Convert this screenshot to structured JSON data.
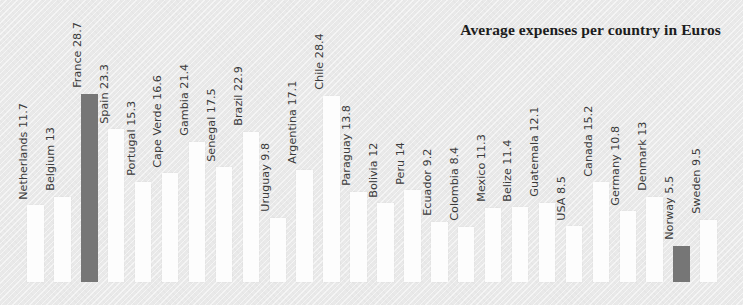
{
  "chart_data": {
    "type": "bar",
    "title": "Average expenses per country in Euros",
    "xlabel": "",
    "ylabel": "",
    "ylim": [
      0,
      28.7
    ],
    "grid": false,
    "legend": "none",
    "value_unit": "Euros",
    "categories": [
      "Netherlands",
      "Belgium",
      "France",
      "Spain",
      "Portugal",
      "Cape Verde",
      "Gambia",
      "Senegal",
      "Brazil",
      "Uruguay",
      "Argentina",
      "Chile",
      "Paraguay",
      "Bolivia",
      "Peru",
      "Ecuador",
      "Colombia",
      "Mexico",
      "Belize",
      "Guatemala",
      "USA",
      "Canada",
      "Germany",
      "Denmark",
      "Norway",
      "Sweden"
    ],
    "values": [
      11.7,
      13,
      28.7,
      23.3,
      15.3,
      16.6,
      21.4,
      17.5,
      22.9,
      9.8,
      17.1,
      28.4,
      13.8,
      12,
      14,
      9.2,
      8.4,
      11.3,
      11.4,
      12.1,
      8.5,
      15.2,
      10.8,
      13,
      5.5,
      9.5
    ],
    "bar_labels": [
      "Netherlands 11.7",
      "Belgium 13",
      "France 28.7",
      "Spain 23.3",
      "Portugal 15.3",
      "Cape Verde 16.6",
      "Gambia 21.4",
      "Senegal 17.5",
      "Brazil 22.9",
      "Uruguay 9.8",
      "Argentina 17.1",
      "Chile 28.4",
      "Paraguay 13.8",
      "Bolivia 12",
      "Peru 14",
      "Ecuador 9.2",
      "Colombia 8.4",
      "Mexico 11.3",
      "Belize 11.4",
      "Guatemala 12.1",
      "USA 8.5",
      "Canada 15.2",
      "Germany 10.8",
      "Denmark 13",
      "Norway 5.5",
      "Sweden 9.5"
    ],
    "highlighted": [
      "France",
      "Norway"
    ],
    "colors": {
      "background": "#e9e9e9",
      "bar": "#fdfdfd",
      "bar_highlight": "#767676",
      "label_text": "#3b3b3b",
      "title_text": "#1d1d1d"
    }
  }
}
